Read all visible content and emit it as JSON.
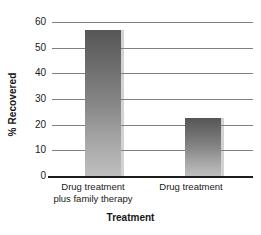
{
  "chart_data": {
    "type": "bar",
    "title": "",
    "xlabel": "Treatment",
    "ylabel": "% Recovered",
    "categories": [
      "Drug treatment plus family therapy",
      "Drug treatment"
    ],
    "category_lines": [
      [
        "Drug treatment",
        "plus family therapy"
      ],
      [
        "Drug treatment",
        ""
      ]
    ],
    "values": [
      57,
      22.5
    ],
    "ylim": [
      0,
      60
    ],
    "yticks": [
      0,
      10,
      20,
      30,
      40,
      50,
      60
    ],
    "ytick_labels": [
      "0",
      "10",
      "20",
      "30",
      "40",
      "50",
      "60"
    ],
    "grid": "horizontal",
    "legend": "none",
    "bar_color_top": "#565656",
    "bar_color_bottom": "#bfbfbf",
    "gridline_color": "#808080",
    "axis_color": "#1d1d1d"
  }
}
